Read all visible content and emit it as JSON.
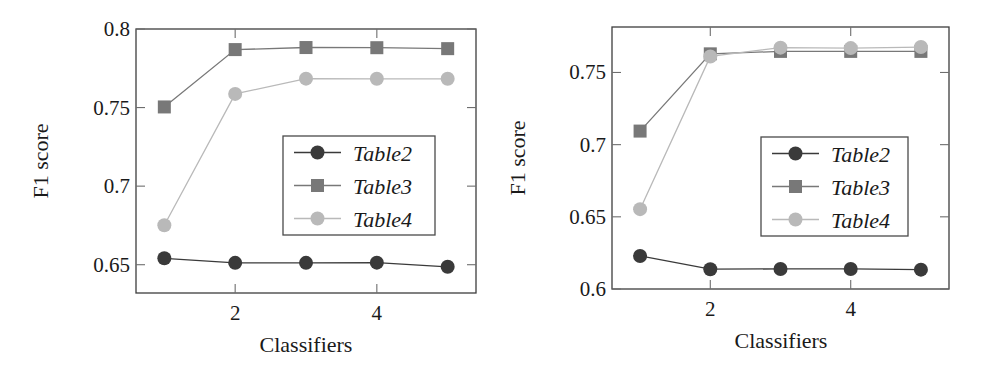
{
  "figure": {
    "panels": [
      {
        "name": "left-panel",
        "xlabel": "Classifiers",
        "ylabel": "F1 score",
        "xticks": [
          "2",
          "4"
        ],
        "xtick_values": [
          2,
          4
        ],
        "yticks": [
          "0.8",
          "0.75",
          "0.7",
          "0.65"
        ],
        "ytick_values": [
          0.8,
          0.75,
          0.7,
          0.65
        ],
        "legend": [
          "Table2",
          "Table3",
          "Table4"
        ]
      },
      {
        "name": "right-panel",
        "xlabel": "Classifiers",
        "ylabel": "F1 score",
        "xticks": [
          "2",
          "4"
        ],
        "xtick_values": [
          2,
          4
        ],
        "yticks": [
          "0.75",
          "0.7",
          "0.65",
          "0.6"
        ],
        "ytick_values": [
          0.75,
          0.7,
          0.65,
          0.6
        ],
        "legend": [
          "Table2",
          "Table3",
          "Table4"
        ]
      }
    ]
  },
  "colors": {
    "table2": "#3a3a3a",
    "table3": "#787878",
    "table4": "#b9b9b9",
    "frame": "#3d3d3d",
    "text": "#1a1a1a",
    "background": "#ffffff"
  },
  "chart_data": [
    {
      "type": "line",
      "title": "",
      "panel": "left",
      "xlabel": "Classifiers",
      "ylabel": "F1 score",
      "x": [
        1,
        2,
        3,
        4,
        5
      ],
      "xlim": [
        0.6,
        5.4
      ],
      "ylim": [
        0.632,
        0.8
      ],
      "xticks": [
        2,
        4
      ],
      "yticks": [
        0.65,
        0.7,
        0.75,
        0.8
      ],
      "grid": false,
      "legend_position": "center-right",
      "series": [
        {
          "name": "Table2",
          "marker": "circle",
          "color": "#3a3a3a",
          "values": [
            0.6541,
            0.6512,
            0.6512,
            0.6513,
            0.6487
          ]
        },
        {
          "name": "Table3",
          "marker": "square",
          "color": "#787878",
          "values": [
            0.7504,
            0.7869,
            0.7882,
            0.7881,
            0.7875
          ]
        },
        {
          "name": "Table4",
          "marker": "circle",
          "color": "#b9b9b9",
          "values": [
            0.6751,
            0.7587,
            0.7684,
            0.7683,
            0.7683
          ]
        }
      ]
    },
    {
      "type": "line",
      "title": "",
      "panel": "right",
      "xlabel": "Classifiers",
      "ylabel": "F1 score",
      "x": [
        1,
        2,
        3,
        4,
        5
      ],
      "xlim": [
        0.6,
        5.4
      ],
      "ylim": [
        0.6,
        0.7815
      ],
      "xticks": [
        2,
        4
      ],
      "yticks": [
        0.6,
        0.65,
        0.7,
        0.75
      ],
      "grid": false,
      "legend_position": "center-right",
      "series": [
        {
          "name": "Table2",
          "marker": "circle",
          "color": "#3a3a3a",
          "values": [
            0.6229,
            0.6137,
            0.6139,
            0.6139,
            0.6134
          ]
        },
        {
          "name": "Table3",
          "marker": "square",
          "color": "#787878",
          "values": [
            0.7094,
            0.7629,
            0.7646,
            0.7646,
            0.7646
          ]
        },
        {
          "name": "Table4",
          "marker": "circle",
          "color": "#b9b9b9",
          "values": [
            0.6553,
            0.7611,
            0.7672,
            0.7669,
            0.7676
          ]
        }
      ]
    }
  ]
}
